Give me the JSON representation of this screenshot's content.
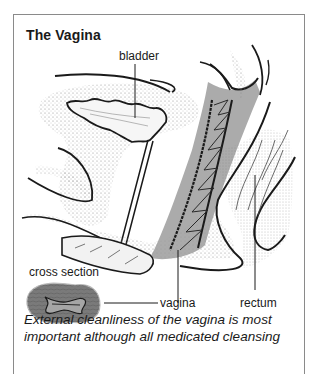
{
  "figure": {
    "title": "The Vagina",
    "labels": {
      "bladder": "bladder",
      "cross_section": "cross section",
      "vagina": "vagina",
      "rectum": "rectum"
    },
    "caption_lines": [
      "External cleanliness of the vagina is most",
      "important although all medicated cleansing"
    ],
    "colors": {
      "border": "#8a8a8a",
      "ink": "#1a1a1a",
      "shade": "#8c8c8c",
      "stipple": "#9a9a9a"
    }
  }
}
